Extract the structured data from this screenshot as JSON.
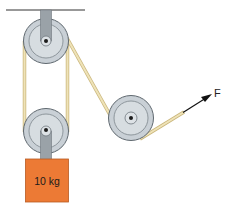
{
  "diagram": {
    "mass_label": "10 kg",
    "force_label": "F",
    "colors": {
      "background": "#ffffff",
      "ceiling": "#333333",
      "pulley_outer": "#c9d0d6",
      "pulley_rim": "#6e777e",
      "pulley_inner": "#dde2e6",
      "bracket": "#9aa2a8",
      "rope": "#e8d9a8",
      "rope_edge": "#c9b57a",
      "block": "#ec7a35",
      "block_edge": "#b85a22",
      "arrow": "#111111"
    },
    "components": [
      {
        "name": "ceiling",
        "type": "fixed support"
      },
      {
        "name": "top-pulley",
        "type": "fixed pulley"
      },
      {
        "name": "bottom-pulley",
        "type": "movable pulley"
      },
      {
        "name": "right-pulley",
        "type": "redirect pulley"
      },
      {
        "name": "mass-block",
        "label": "10 kg"
      },
      {
        "name": "force-arrow",
        "label": "F"
      }
    ]
  }
}
